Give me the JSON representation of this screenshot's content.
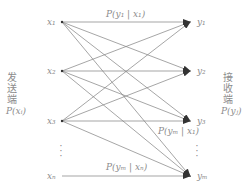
{
  "diagram": {
    "type": "channel-transition-diagram",
    "sender": {
      "label_chars": [
        "发",
        "送",
        "端"
      ],
      "prob": "P(xᵢ)"
    },
    "receiver": {
      "label_chars": [
        "接",
        "收",
        "端"
      ],
      "prob": "P(yⱼ)"
    },
    "inputs": [
      "x₁",
      "x₂",
      "x₃",
      "xₙ"
    ],
    "outputs": [
      "y₁",
      "y₂",
      "y₃",
      "yₘ"
    ],
    "edge_labels": {
      "top": "P(y₁ | x₁)",
      "middle": "P(yₘ | x₁)",
      "bottom": "P(yₘ | xₙ)"
    },
    "ellipsis": "⋮",
    "colors": {
      "line": "#7a7a7a",
      "arrow": "#333333",
      "text": "#8c8c8c"
    }
  }
}
